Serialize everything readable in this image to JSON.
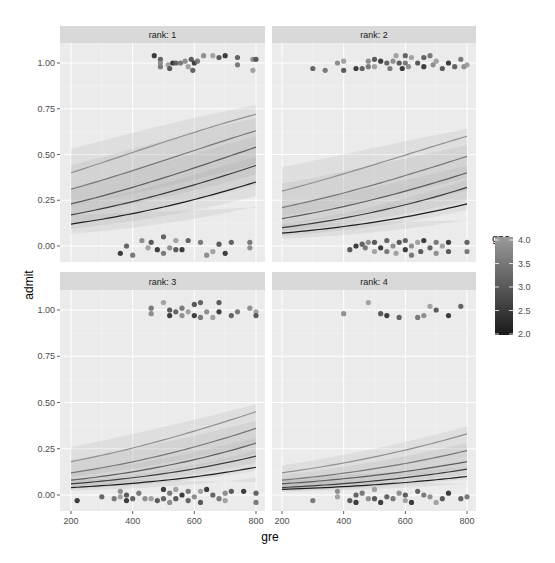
{
  "chart_data": {
    "type": "line",
    "title": "",
    "xlabel": "gre",
    "ylabel": "admit",
    "xlim": [
      200,
      800
    ],
    "ylim": [
      -0.05,
      1.05
    ],
    "xticks": [
      200,
      400,
      600,
      800
    ],
    "xtick_labels": [
      "200",
      "400",
      "600",
      "800"
    ],
    "yticks": [
      0,
      0.25,
      0.5,
      0.75,
      1
    ],
    "ytick_labels": [
      "0.00",
      "0.25",
      "0.50",
      "0.75",
      "1.00"
    ],
    "grid": true,
    "facet_variable": "rank",
    "legend": {
      "title": "gpa",
      "type": "colorbar",
      "position": "right",
      "range": [
        2.0,
        4.0
      ],
      "ticks": [
        "4.0",
        "3.5",
        "3.0",
        "2.5",
        "2.0"
      ],
      "low_color": "#1a1a1a",
      "high_color": "#9a9a9a"
    },
    "panels": [
      {
        "strip": "rank: 1",
        "x": [
          200,
          800
        ],
        "series": [
          {
            "name": "gpa high",
            "values": [
              0.4,
              0.72
            ],
            "color": "#8f8f8f",
            "band": [
              0.53,
              0.77
            ]
          },
          {
            "name": "gpa mid-high",
            "values": [
              0.31,
              0.63
            ],
            "color": "#777777",
            "band": [
              0.44,
              0.7
            ]
          },
          {
            "name": "gpa mid",
            "values": [
              0.23,
              0.54
            ],
            "color": "#5c5c5c",
            "band": [
              0.32,
              0.6
            ]
          },
          {
            "name": "gpa mid-low",
            "values": [
              0.17,
              0.44
            ],
            "color": "#3c3c3c",
            "band": [
              0.22,
              0.49
            ]
          },
          {
            "name": "gpa low",
            "values": [
              0.12,
              0.35
            ],
            "color": "#1e1e1e",
            "band": [
              0.06,
              0.21
            ]
          }
        ],
        "points_admit1": [
          [
            470,
            1.04
          ],
          [
            490,
            1.02
          ],
          [
            490,
            0.98
          ],
          [
            490,
            1.0
          ],
          [
            515,
            0.99
          ],
          [
            520,
            0.97
          ],
          [
            530,
            1.0
          ],
          [
            540,
            1.0
          ],
          [
            555,
            1.0
          ],
          [
            570,
            1.01
          ],
          [
            580,
            0.98
          ],
          [
            590,
            1.02
          ],
          [
            600,
            1.0
          ],
          [
            595,
            0.96
          ],
          [
            610,
            1.01
          ],
          [
            630,
            1.04
          ],
          [
            660,
            1.04
          ],
          [
            680,
            1.03
          ],
          [
            700,
            1.04
          ],
          [
            740,
            1.03
          ],
          [
            740,
            0.99
          ],
          [
            790,
            1.02
          ],
          [
            790,
            0.96
          ],
          [
            800,
            1.02
          ]
        ],
        "points_admit0": [
          [
            360,
            -0.04
          ],
          [
            380,
            0.0
          ],
          [
            400,
            -0.05
          ],
          [
            430,
            0.03
          ],
          [
            450,
            -0.01
          ],
          [
            460,
            0.02
          ],
          [
            480,
            -0.02
          ],
          [
            500,
            0.05
          ],
          [
            500,
            -0.04
          ],
          [
            520,
            -0.01
          ],
          [
            540,
            0.03
          ],
          [
            540,
            -0.02
          ],
          [
            560,
            -0.02
          ],
          [
            580,
            0.03
          ],
          [
            620,
            0.02
          ],
          [
            640,
            -0.05
          ],
          [
            660,
            -0.03
          ],
          [
            680,
            0.01
          ],
          [
            700,
            -0.04
          ],
          [
            720,
            0.02
          ],
          [
            780,
            0.02
          ],
          [
            780,
            -0.01
          ]
        ]
      },
      {
        "strip": "rank: 2",
        "x": [
          200,
          800
        ],
        "series": [
          {
            "name": "gpa high",
            "values": [
              0.3,
              0.6
            ],
            "color": "#8f8f8f",
            "band": [
              0.43,
              0.64
            ]
          },
          {
            "name": "gpa mid-high",
            "values": [
              0.21,
              0.49
            ],
            "color": "#777777",
            "band": [
              0.34,
              0.55
            ]
          },
          {
            "name": "gpa mid",
            "values": [
              0.15,
              0.4
            ],
            "color": "#5c5c5c",
            "band": [
              0.22,
              0.44
            ]
          },
          {
            "name": "gpa mid-low",
            "values": [
              0.1,
              0.32
            ],
            "color": "#3c3c3c",
            "band": [
              0.12,
              0.36
            ]
          },
          {
            "name": "gpa low",
            "values": [
              0.07,
              0.23
            ],
            "color": "#1e1e1e",
            "band": [
              0.02,
              0.14
            ]
          }
        ],
        "points_admit1": [
          [
            300,
            0.97
          ],
          [
            340,
            0.96
          ],
          [
            380,
            1.0
          ],
          [
            400,
            1.01
          ],
          [
            400,
            0.96
          ],
          [
            440,
            0.97
          ],
          [
            460,
            0.97
          ],
          [
            480,
            0.98
          ],
          [
            480,
            1.01
          ],
          [
            500,
            0.98
          ],
          [
            500,
            1.02
          ],
          [
            520,
            1.01
          ],
          [
            540,
            1.0
          ],
          [
            550,
            0.97
          ],
          [
            560,
            1.01
          ],
          [
            570,
            1.04
          ],
          [
            580,
            1.0
          ],
          [
            590,
            0.97
          ],
          [
            600,
            1.04
          ],
          [
            600,
            1.0
          ],
          [
            610,
            0.98
          ],
          [
            620,
            1.03
          ],
          [
            640,
            1.0
          ],
          [
            660,
            0.98
          ],
          [
            660,
            1.03
          ],
          [
            680,
            1.04
          ],
          [
            690,
            0.99
          ],
          [
            700,
            1.01
          ],
          [
            720,
            0.97
          ],
          [
            740,
            1.0
          ],
          [
            760,
            0.98
          ],
          [
            780,
            1.02
          ],
          [
            790,
            0.98
          ],
          [
            800,
            0.99
          ]
        ],
        "points_admit0": [
          [
            420,
            -0.02
          ],
          [
            440,
            0.0
          ],
          [
            460,
            0.01
          ],
          [
            470,
            -0.01
          ],
          [
            480,
            0.02
          ],
          [
            500,
            -0.03
          ],
          [
            500,
            0.02
          ],
          [
            520,
            -0.01
          ],
          [
            540,
            0.03
          ],
          [
            540,
            -0.03
          ],
          [
            560,
            0.0
          ],
          [
            570,
            -0.04
          ],
          [
            580,
            0.02
          ],
          [
            600,
            -0.02
          ],
          [
            600,
            0.03
          ],
          [
            620,
            -0.05
          ],
          [
            620,
            0.0
          ],
          [
            640,
            0.02
          ],
          [
            650,
            -0.03
          ],
          [
            660,
            0.03
          ],
          [
            680,
            -0.01
          ],
          [
            700,
            0.02
          ],
          [
            700,
            -0.04
          ],
          [
            720,
            0.0
          ],
          [
            740,
            -0.03
          ],
          [
            740,
            0.02
          ],
          [
            800,
            0.02
          ],
          [
            800,
            -0.03
          ]
        ]
      },
      {
        "strip": "rank: 3",
        "x": [
          200,
          800
        ],
        "series": [
          {
            "name": "gpa high",
            "values": [
              0.18,
              0.45
            ],
            "color": "#8f8f8f",
            "band": [
              0.26,
              0.49
            ]
          },
          {
            "name": "gpa mid-high",
            "values": [
              0.12,
              0.36
            ],
            "color": "#777777",
            "band": [
              0.19,
              0.4
            ]
          },
          {
            "name": "gpa mid",
            "values": [
              0.08,
              0.28
            ],
            "color": "#5c5c5c",
            "band": [
              0.12,
              0.31
            ]
          },
          {
            "name": "gpa mid-low",
            "values": [
              0.06,
              0.21
            ],
            "color": "#3c3c3c",
            "band": [
              0.07,
              0.24
            ]
          },
          {
            "name": "gpa low",
            "values": [
              0.04,
              0.15
            ],
            "color": "#1e1e1e",
            "band": [
              0.02,
              0.07
            ]
          }
        ],
        "points_admit1": [
          [
            460,
            1.01
          ],
          [
            460,
            0.98
          ],
          [
            500,
            1.04
          ],
          [
            520,
            1.0
          ],
          [
            520,
            0.97
          ],
          [
            540,
            0.99
          ],
          [
            560,
            1.01
          ],
          [
            560,
            0.97
          ],
          [
            580,
            0.99
          ],
          [
            600,
            1.03
          ],
          [
            600,
            0.97
          ],
          [
            620,
            1.04
          ],
          [
            620,
            0.96
          ],
          [
            640,
            0.99
          ],
          [
            660,
            0.96
          ],
          [
            680,
            1.04
          ],
          [
            680,
            0.99
          ],
          [
            720,
            0.97
          ],
          [
            740,
            0.99
          ],
          [
            780,
            1.01
          ],
          [
            800,
            0.99
          ],
          [
            800,
            0.97
          ]
        ],
        "points_admit0": [
          [
            220,
            -0.03
          ],
          [
            300,
            -0.01
          ],
          [
            340,
            -0.02
          ],
          [
            360,
            0.02
          ],
          [
            360,
            -0.01
          ],
          [
            380,
            0.0
          ],
          [
            380,
            -0.03
          ],
          [
            400,
            -0.02
          ],
          [
            420,
            0.01
          ],
          [
            440,
            -0.02
          ],
          [
            460,
            -0.02
          ],
          [
            480,
            -0.03
          ],
          [
            500,
            0.03
          ],
          [
            500,
            -0.02
          ],
          [
            520,
            0.01
          ],
          [
            520,
            -0.04
          ],
          [
            540,
            0.03
          ],
          [
            540,
            -0.02
          ],
          [
            560,
            0.0
          ],
          [
            580,
            -0.03
          ],
          [
            580,
            0.02
          ],
          [
            600,
            -0.01
          ],
          [
            620,
            0.02
          ],
          [
            620,
            -0.04
          ],
          [
            640,
            0.03
          ],
          [
            660,
            0.0
          ],
          [
            680,
            -0.02
          ],
          [
            700,
            0.01
          ],
          [
            700,
            -0.03
          ],
          [
            720,
            0.02
          ],
          [
            760,
            0.02
          ],
          [
            800,
            0.01
          ],
          [
            800,
            -0.04
          ]
        ]
      },
      {
        "strip": "rank: 4",
        "x": [
          200,
          800
        ],
        "series": [
          {
            "name": "gpa high",
            "values": [
              0.12,
              0.33
            ],
            "color": "#8f8f8f",
            "band": [
              0.16,
              0.37
            ]
          },
          {
            "name": "gpa mid-high",
            "values": [
              0.08,
              0.24
            ],
            "color": "#777777",
            "band": [
              0.11,
              0.28
            ]
          },
          {
            "name": "gpa mid",
            "values": [
              0.06,
              0.18
            ],
            "color": "#5c5c5c",
            "band": [
              0.07,
              0.2
            ]
          },
          {
            "name": "gpa mid-low",
            "values": [
              0.04,
              0.14
            ],
            "color": "#3c3c3c",
            "band": [
              0.04,
              0.15
            ]
          },
          {
            "name": "gpa low",
            "values": [
              0.03,
              0.1
            ],
            "color": "#1e1e1e",
            "band": [
              0.02,
              0.06
            ]
          }
        ],
        "points_admit1": [
          [
            400,
            0.98
          ],
          [
            480,
            1.04
          ],
          [
            520,
            0.98
          ],
          [
            540,
            0.97
          ],
          [
            580,
            0.96
          ],
          [
            640,
            0.96
          ],
          [
            660,
            0.97
          ],
          [
            680,
            1.02
          ],
          [
            700,
            1.0
          ],
          [
            740,
            0.97
          ],
          [
            780,
            1.02
          ]
        ],
        "points_admit0": [
          [
            300,
            -0.03
          ],
          [
            380,
            0.02
          ],
          [
            380,
            -0.01
          ],
          [
            420,
            -0.03
          ],
          [
            440,
            -0.04
          ],
          [
            440,
            0.0
          ],
          [
            460,
            0.01
          ],
          [
            480,
            -0.02
          ],
          [
            500,
            0.03
          ],
          [
            500,
            -0.02
          ],
          [
            520,
            -0.04
          ],
          [
            540,
            -0.01
          ],
          [
            560,
            -0.02
          ],
          [
            580,
            0.01
          ],
          [
            600,
            -0.03
          ],
          [
            600,
            0.0
          ],
          [
            620,
            -0.04
          ],
          [
            640,
            0.02
          ],
          [
            660,
            0.0
          ],
          [
            680,
            -0.01
          ],
          [
            700,
            -0.04
          ],
          [
            720,
            -0.02
          ],
          [
            740,
            0.01
          ],
          [
            780,
            -0.02
          ],
          [
            800,
            -0.01
          ]
        ]
      }
    ]
  },
  "colors": {
    "panel_bg": "#ebebeb",
    "strip_bg": "#d9d9d9",
    "grid_major": "#ffffff",
    "grid_minor": "#f5f5f5"
  }
}
